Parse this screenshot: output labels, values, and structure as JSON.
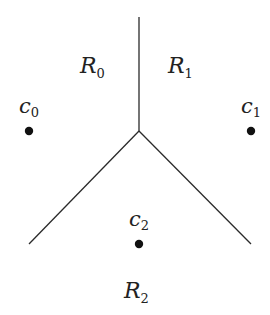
{
  "diagram": {
    "type": "voronoi-partition",
    "colors": {
      "background": "#ffffff",
      "line": "#2a2a2a",
      "point": "#111111",
      "text": "#222222"
    },
    "junction": {
      "x": 139,
      "y": 131
    },
    "boundaries": [
      {
        "name": "boundary-r0-r1",
        "x1": 139,
        "y1": 17,
        "x2": 139,
        "y2": 131
      },
      {
        "name": "boundary-r0-r2",
        "x1": 139,
        "y1": 131,
        "x2": 29,
        "y2": 244
      },
      {
        "name": "boundary-r1-r2",
        "x1": 139,
        "y1": 131,
        "x2": 251,
        "y2": 244
      }
    ],
    "regions": [
      {
        "symbol": "R",
        "subscript": "0",
        "x": 80,
        "y": 73
      },
      {
        "symbol": "R",
        "subscript": "1",
        "x": 168,
        "y": 73
      },
      {
        "symbol": "R",
        "subscript": "2",
        "x": 124,
        "y": 298
      }
    ],
    "centroids": [
      {
        "symbol": "c",
        "subscript": "0",
        "dot_x": 29,
        "dot_y": 131,
        "label_x": 19,
        "label_y": 113
      },
      {
        "symbol": "c",
        "subscript": "1",
        "dot_x": 251,
        "dot_y": 131,
        "label_x": 241,
        "label_y": 113
      },
      {
        "symbol": "c",
        "subscript": "2",
        "dot_x": 139,
        "dot_y": 244,
        "label_x": 129,
        "label_y": 226
      }
    ]
  }
}
